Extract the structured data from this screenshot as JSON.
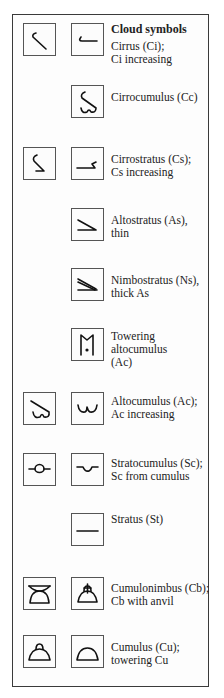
{
  "title": "Cloud symbols",
  "rows": [
    {
      "id": "ci",
      "left_symbol": "cirrus-icon",
      "right_symbol": "cirrus-increasing-icon",
      "lines": [
        "Cirrus (Ci);",
        "Ci increasing"
      ]
    },
    {
      "id": "cc",
      "left_symbol": null,
      "right_symbol": "cirrocumulus-icon",
      "lines": [
        "Cirrocumulus (Cc)"
      ]
    },
    {
      "id": "cs",
      "left_symbol": "cirrostratus-icon",
      "right_symbol": "cirrostratus-increasing-icon",
      "lines": [
        "Cirrostratus (Cs);",
        "Cs increasing"
      ]
    },
    {
      "id": "as",
      "left_symbol": null,
      "right_symbol": "altostratus-thin-icon",
      "lines": [
        "Altostratus (As),",
        "thin"
      ]
    },
    {
      "id": "ns",
      "left_symbol": null,
      "right_symbol": "nimbostratus-icon",
      "lines": [
        "Nimbostratus (Ns),",
        "thick As"
      ]
    },
    {
      "id": "ac-tower",
      "left_symbol": null,
      "right_symbol": "towering-altocumulus-icon",
      "lines": [
        "Towering",
        "altocumulus",
        "(Ac)"
      ]
    },
    {
      "id": "ac",
      "left_symbol": "altocumulus-icon",
      "right_symbol": "altocumulus-increasing-icon",
      "lines": [
        "Altocumulus (Ac);",
        "Ac increasing"
      ]
    },
    {
      "id": "sc",
      "left_symbol": "stratocumulus-icon",
      "right_symbol": "stratocumulus-from-cumulus-icon",
      "lines": [
        "Stratocumulus (Sc);",
        "Sc from cumulus"
      ]
    },
    {
      "id": "st",
      "left_symbol": null,
      "right_symbol": "stratus-icon",
      "lines": [
        "Stratus (St)"
      ]
    },
    {
      "id": "cb",
      "left_symbol": "cumulonimbus-icon",
      "right_symbol": "cumulonimbus-anvil-icon",
      "lines": [
        "Cumulonimbus (Cb);",
        "Cb with anvil"
      ]
    },
    {
      "id": "cu",
      "left_symbol": "cumulus-icon",
      "right_symbol": "towering-cumulus-icon",
      "lines": [
        "Cumulus (Cu);",
        "towering Cu"
      ]
    }
  ]
}
